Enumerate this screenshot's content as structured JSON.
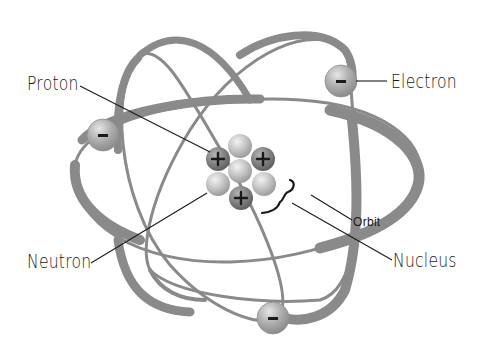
{
  "diagram": {
    "labels": {
      "proton": "Proton",
      "electron": "Electron",
      "neutron": "Neutron",
      "nucleus": "Nucleus",
      "orbit": "Orbit"
    },
    "symbols": {
      "proton_charge": "+",
      "electron_charge": "-"
    },
    "counts": {
      "protons": 3,
      "neutrons": 4,
      "electrons": 3,
      "orbits": 3
    },
    "colors": {
      "orbit": "#8a8a8a",
      "proton": "#7c7c7c",
      "neutron": "#bdbdbd",
      "electron": "#a6a6a6",
      "leader_line": "#1a1a1a",
      "background": "#ffffff"
    }
  }
}
